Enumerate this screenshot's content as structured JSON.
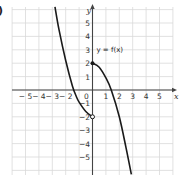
{
  "part_label": ")",
  "chart_data": {
    "type": "line",
    "title": "",
    "xlabel": "x",
    "ylabel": "y",
    "xlim": [
      -6,
      6
    ],
    "ylim": [
      -6.3,
      6.2
    ],
    "grid": true,
    "x_ticks": [
      "-5",
      "-4",
      "-3",
      "-2",
      "0",
      "1",
      "2",
      "3",
      "4",
      "5"
    ],
    "y_ticks": [
      "5",
      "4",
      "3",
      "2",
      "1",
      "-1",
      "-2",
      "-3",
      "-4",
      "-5"
    ],
    "curve_label": "y = f(x)",
    "series": [
      {
        "name": "f(x) left piece",
        "x": [
          -2.8,
          -2.5,
          -2,
          -1.5,
          -1.2,
          -1,
          -0.5,
          0
        ],
        "y": [
          6.2,
          4.5,
          2.2,
          0.3,
          -0.5,
          -0.9,
          -1.6,
          -2
        ],
        "end_marker": "open circle at (0,-2)"
      },
      {
        "name": "f(x) right piece",
        "x": [
          0,
          0.5,
          1,
          1.4,
          2,
          2.5,
          2.9
        ],
        "y": [
          2,
          1.7,
          0.9,
          0,
          -2,
          -4.3,
          -6.3
        ],
        "start_marker": "filled dot at (0,2)"
      }
    ]
  },
  "colors": {
    "grid": "#d9d9d9",
    "axis": "#444444",
    "curve": "#1a1a1a"
  }
}
